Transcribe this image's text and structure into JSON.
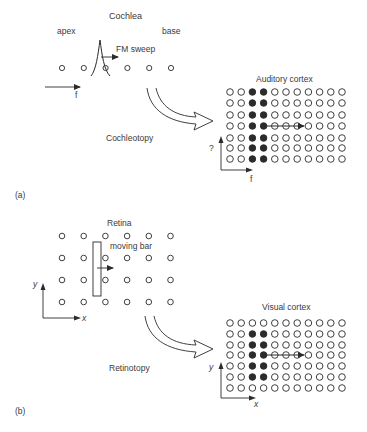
{
  "panel_a": {
    "label": "(a)",
    "cochlea": {
      "title": "Cochlea",
      "apex_label": "apex",
      "base_label": "base",
      "sweep_label": "FM sweep",
      "axis_label": "f",
      "receptor_count": 6
    },
    "transform_label": "Cochleotopy",
    "cortex": {
      "title": "Auditory cortex",
      "rows": 7,
      "cols": 11,
      "filled_cols": [
        2,
        3
      ],
      "filled_rows": [
        0,
        1,
        2,
        3,
        4,
        5,
        6
      ],
      "arrow_row": 3,
      "x_axis_label": "f",
      "y_axis_label": "?"
    }
  },
  "panel_b": {
    "label": "(b)",
    "retina": {
      "title": "Retina",
      "stimulus_label": "moving bar",
      "rows": 4,
      "cols": 6,
      "x_axis_label": "x",
      "y_axis_label": "y"
    },
    "transform_label": "Retinotopy",
    "cortex": {
      "title": "Visual cortex",
      "rows": 7,
      "cols": 11,
      "filled_cols": [
        2,
        3
      ],
      "filled_rows": [
        1,
        2,
        3,
        4,
        5
      ],
      "arrow_row": 3,
      "x_axis_label": "x",
      "y_axis_label": "y"
    }
  },
  "colors": {
    "stroke": "#2b2b2b",
    "text": "#3a3a3a",
    "background": "#ffffff"
  }
}
